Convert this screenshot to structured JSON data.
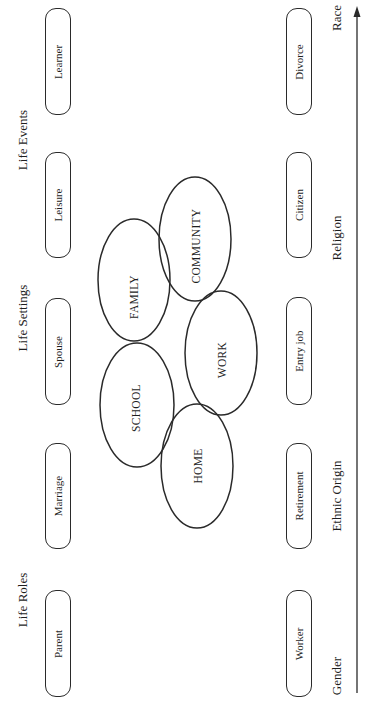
{
  "headings": {
    "life_events": "Life Events",
    "life_settings": "Life Settings",
    "life_roles": "Life Roles"
  },
  "left_boxes": [
    "Learner",
    "Leisure",
    "Spouse",
    "Marriage",
    "Parent"
  ],
  "right_boxes": [
    "Divorce",
    "Citizen",
    "Entry job",
    "Retirement",
    "Worker"
  ],
  "ellipses": {
    "family": "FAMILY",
    "community": "COMMUNITY",
    "school": "SCHOOL",
    "work": "WORK",
    "home": "HOME"
  },
  "context_labels": {
    "race": "Race",
    "religion": "Religion",
    "ethnic_origin": "Ethnic Origin",
    "gender": "Gender"
  },
  "colors": {
    "stroke": "#2a2a2a",
    "text": "#1e1e1e",
    "background": "#ffffff"
  }
}
